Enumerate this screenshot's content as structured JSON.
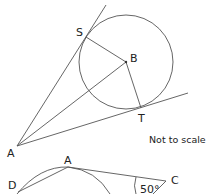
{
  "figure_1": {
    "points": {
      "A": "A",
      "S": "S",
      "B": "B",
      "T": "T"
    },
    "note": "Not to scale",
    "description": "Circle with centre B; tangents from external point A touch the circle at S and T; radii BS and BT and line AB drawn"
  },
  "figure_2": {
    "points": {
      "A": "A",
      "C": "C",
      "D": "D"
    },
    "angle_label": "50°",
    "description": "Partial circle through D and A; line DA and line AC with angle 50° at C"
  },
  "colors": {
    "line": "#555555",
    "text": "#222222",
    "background": "#ffffff"
  }
}
